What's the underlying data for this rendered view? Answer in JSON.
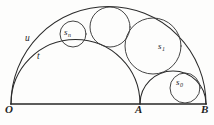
{
  "figure": {
    "background_color": "#fdfdfc",
    "line_color": "#2b2b2b",
    "points": [
      {
        "id": "O",
        "label": "O",
        "x": 11,
        "y": 104
      },
      {
        "id": "A",
        "label": "A",
        "x": 140,
        "y": 104
      },
      {
        "id": "B",
        "label": "B",
        "x": 206,
        "y": 104
      }
    ],
    "arcs": [
      {
        "id": "u",
        "label": "u",
        "description": "outer semicircle on diameter OB",
        "cx": 108.5,
        "cy": 104,
        "r": 97.5
      },
      {
        "id": "t",
        "label": "t",
        "description": "inner semicircle on diameter OA",
        "cx": 75.5,
        "cy": 104,
        "r": 64.5
      },
      {
        "id": "ab",
        "label": "",
        "description": "small semicircle on diameter AB",
        "cx": 173,
        "cy": 104,
        "r": 33
      }
    ],
    "circles": [
      {
        "id": "s0",
        "label": "s",
        "subscript": "0",
        "cx": 185,
        "cy": 88,
        "r": 15
      },
      {
        "id": "s1",
        "label": "s",
        "subscript": "1",
        "cx": 153,
        "cy": 46,
        "r": 28
      },
      {
        "id": "s2",
        "label": "",
        "subscript": "",
        "cx": 110,
        "cy": 27,
        "r": 20
      },
      {
        "id": "sn",
        "label": "s",
        "subscript": "n",
        "cx": 73,
        "cy": 34,
        "r": 13
      }
    ],
    "labels": [
      {
        "id": "label-O",
        "text": "O",
        "x": 6,
        "y": 108
      },
      {
        "id": "label-A",
        "text": "A",
        "x": 136,
        "y": 108
      },
      {
        "id": "label-B",
        "text": "B",
        "x": 202,
        "y": 108
      },
      {
        "id": "label-u",
        "text": "u",
        "x": 26,
        "y": 38
      },
      {
        "id": "label-t",
        "text": "t",
        "x": 37,
        "y": 56
      },
      {
        "id": "label-sn",
        "text": "s",
        "sub": "n",
        "x": 64,
        "y": 28
      },
      {
        "id": "label-s1",
        "text": "s",
        "sub": "1",
        "x": 158,
        "y": 44
      },
      {
        "id": "label-s0",
        "text": "s",
        "sub": "0",
        "x": 177,
        "y": 80
      }
    ]
  }
}
